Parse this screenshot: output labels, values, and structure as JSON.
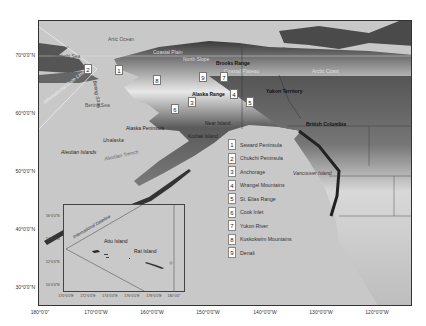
{
  "map": {
    "water_labels": {
      "arctic_ocean": "Artic Ocean",
      "chukchi_sea": "Chukchi Sea",
      "beaufort_sea": "Beaufort Sea",
      "bering_sea": "Bering Sea",
      "gulf_of_alaska": "Gulf of Alaska",
      "bering_strait": "Bering Strait",
      "aleutian_trench": "Aleutian Trench"
    },
    "land_labels": {
      "coastal_plain": "Coastal Plain",
      "north_slope": "North Slope",
      "brooks_range": "Brooks Range",
      "coastal_plateau": "Coastal Plateau",
      "arctic_coast": "Arctic Coast",
      "alaska_range": "Alaska Range",
      "yukon_territory": "Yukon Territory",
      "british_columbia": "British Columbia",
      "alaska_peninsula": "Alaska Peninsula",
      "near_island": "Near Island",
      "kodiak_island": "Kodiak Island",
      "unalaska": "Unalaska",
      "aleutian_islands": "Aleutian Islands",
      "vancouver_island": "Vancouver Island",
      "international_date_line": "International Date Line"
    },
    "markers": [
      {
        "n": "1",
        "x": 115,
        "y": 65
      },
      {
        "n": "2",
        "x": 84,
        "y": 64
      },
      {
        "n": "3",
        "x": 188,
        "y": 97
      },
      {
        "n": "4",
        "x": 230,
        "y": 89
      },
      {
        "n": "5",
        "x": 246,
        "y": 97
      },
      {
        "n": "6",
        "x": 171,
        "y": 104
      },
      {
        "n": "7",
        "x": 220,
        "y": 72
      },
      {
        "n": "8",
        "x": 153,
        "y": 75
      },
      {
        "n": "9",
        "x": 199,
        "y": 72
      }
    ],
    "legend": [
      {
        "n": "1",
        "label": "Seward Peninsula"
      },
      {
        "n": "2",
        "label": "Chukchi Peninsula"
      },
      {
        "n": "3",
        "label": "Anchorage"
      },
      {
        "n": "4",
        "label": "Wrangel Mountains"
      },
      {
        "n": "5",
        "label": "St. Elias Range"
      },
      {
        "n": "6",
        "label": "Cook Inlet"
      },
      {
        "n": "7",
        "label": "Yukon River"
      },
      {
        "n": "8",
        "label": "Kuskokwim Mountains"
      },
      {
        "n": "9",
        "label": "Denali"
      }
    ],
    "y_ticks": [
      {
        "label": "70°0'0\"N",
        "y": 55
      },
      {
        "label": "60°0'0\"N",
        "y": 113
      },
      {
        "label": "50°0'0\"N",
        "y": 171
      },
      {
        "label": "40°0'0\"N",
        "y": 229
      },
      {
        "label": "30°0'0\"N",
        "y": 287
      }
    ],
    "x_ticks": [
      {
        "label": "180°0'0\"",
        "x": 40
      },
      {
        "label": "170°0'0\"W",
        "x": 96
      },
      {
        "label": "160°0'0\"W",
        "x": 152
      },
      {
        "label": "150°0'0\"W",
        "x": 208
      },
      {
        "label": "140°0'0\"W",
        "x": 265
      },
      {
        "label": "130°0'0\"W",
        "x": 321
      },
      {
        "label": "120°0'0\"W",
        "x": 377
      }
    ],
    "inset": {
      "date_line_label": "International Dateline",
      "attu_island": "Attu Island",
      "rat_island": "Rat Island",
      "y_ticks": [
        {
          "label": "56°0'0\"N",
          "y": 9
        },
        {
          "label": "54°0'0\"N",
          "y": 32
        },
        {
          "label": "52°0'0\"N",
          "y": 55
        },
        {
          "label": "50°0'0\"N",
          "y": 78
        }
      ],
      "x_ticks": [
        {
          "label": "170°0'0\"E",
          "x": 2
        },
        {
          "label": "172°0'0\"E",
          "x": 24
        },
        {
          "label": "174°0'0\"E",
          "x": 46
        },
        {
          "label": "176°0'0\"E",
          "x": 68
        },
        {
          "label": "178°0'0\"E",
          "x": 90
        },
        {
          "label": "180°0'0\"",
          "x": 110
        }
      ]
    }
  }
}
